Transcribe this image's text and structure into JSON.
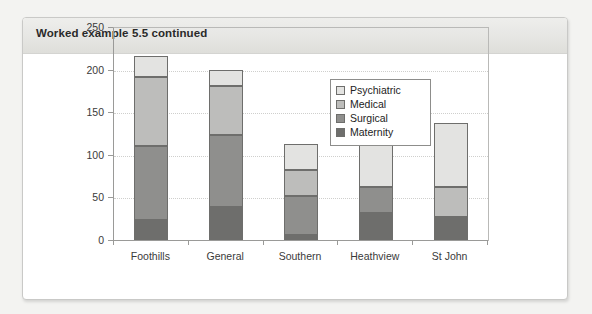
{
  "panel": {
    "title": "Worked example 5.5 continued"
  },
  "legend": {
    "position": "inside-top-right",
    "items": [
      {
        "label": "Psychiatric",
        "color": "#e3e3e1"
      },
      {
        "label": "Medical",
        "color": "#bdbdbb"
      },
      {
        "label": "Surgical",
        "color": "#8f8f8d"
      },
      {
        "label": "Maternity",
        "color": "#6e6e6c"
      }
    ]
  },
  "chart_data": {
    "type": "bar",
    "stacked": true,
    "title": "",
    "subtitle": "",
    "xlabel": "",
    "ylabel": "",
    "grid": true,
    "ylim": [
      0,
      250
    ],
    "yticks": [
      0,
      50,
      100,
      150,
      200,
      250
    ],
    "ytick_labels": [
      "0",
      "50",
      "100",
      "150",
      "200",
      "250"
    ],
    "categories": [
      "Foothills",
      "General",
      "Southern",
      "Heathview",
      "St John"
    ],
    "series": [
      {
        "name": "Maternity",
        "color": "#6e6e6c",
        "values": [
          25,
          40,
          7,
          33,
          28
        ]
      },
      {
        "name": "Surgical",
        "color": "#8f8f8d",
        "values": [
          87,
          85,
          46,
          30,
          0
        ]
      },
      {
        "name": "Medical",
        "color": "#bdbdbb",
        "values": [
          81,
          57,
          30,
          0,
          35
        ]
      },
      {
        "name": "Psychiatric",
        "color": "#e3e3e1",
        "values": [
          24,
          19,
          31,
          65,
          75
        ]
      }
    ],
    "totals": [
      217,
      201,
      114,
      128,
      138
    ]
  }
}
